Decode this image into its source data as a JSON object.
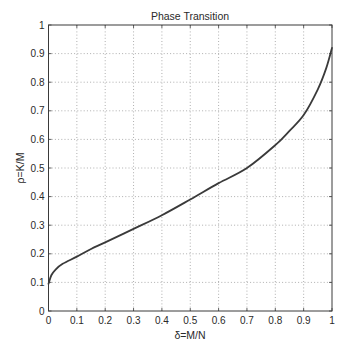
{
  "chart_data": {
    "type": "line",
    "title": "Phase Transition",
    "xlabel": "δ=M/N",
    "ylabel": "ρ=K/M",
    "xlim": [
      0,
      1
    ],
    "ylim": [
      0,
      1
    ],
    "grid": true,
    "legend": null,
    "xticks": [
      "0",
      "0.1",
      "0.2",
      "0.3",
      "0.4",
      "0.5",
      "0.6",
      "0.7",
      "0.8",
      "0.9",
      "1"
    ],
    "yticks": [
      "0",
      "0.1",
      "0.2",
      "0.3",
      "0.4",
      "0.5",
      "0.6",
      "0.7",
      "0.8",
      "0.9",
      "1"
    ],
    "series": [
      {
        "name": "phase transition curve",
        "color": "#3a3a3a",
        "x": [
          0.0,
          0.01,
          0.025,
          0.05,
          0.1,
          0.15,
          0.2,
          0.3,
          0.4,
          0.5,
          0.6,
          0.7,
          0.8,
          0.85,
          0.9,
          0.95,
          0.98,
          1.0
        ],
        "y": [
          0.095,
          0.125,
          0.145,
          0.165,
          0.19,
          0.217,
          0.24,
          0.287,
          0.335,
          0.39,
          0.447,
          0.5,
          0.58,
          0.63,
          0.685,
          0.775,
          0.85,
          0.92
        ]
      }
    ]
  },
  "figure": {
    "background": "#ffffff",
    "axes_color": "#3a3a3a",
    "grid_color": "#9a9a9a"
  }
}
